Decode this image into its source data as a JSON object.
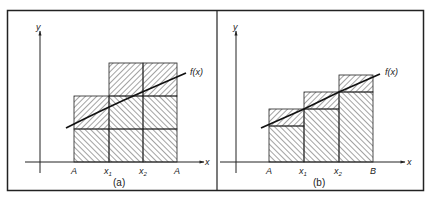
{
  "figure": {
    "panels": [
      {
        "id": "a",
        "caption": "(a)",
        "axis_x_label": "x",
        "axis_y_label": "y",
        "curve_label": "f(x)",
        "tick_labels": [
          "A",
          "x1",
          "x2",
          "A"
        ],
        "tick_label_main": [
          "A",
          "x",
          "x",
          "A"
        ],
        "tick_label_sub": [
          "",
          "1",
          "2",
          ""
        ]
      },
      {
        "id": "b",
        "caption": "(b)",
        "axis_x_label": "x",
        "axis_y_label": "y",
        "curve_label": "f(x)",
        "tick_labels": [
          "A",
          "x1",
          "x2",
          "B"
        ],
        "tick_label_main": [
          "A",
          "x",
          "x",
          "B"
        ],
        "tick_label_sub": [
          "",
          "1",
          "2",
          ""
        ]
      }
    ],
    "colors": {
      "stroke": "#222222",
      "background": "#ffffff"
    }
  }
}
